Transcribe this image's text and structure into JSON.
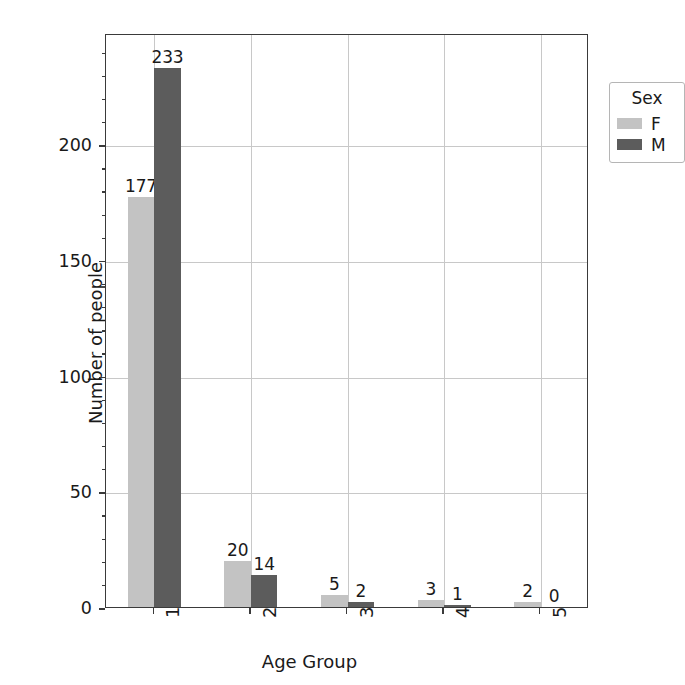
{
  "chart_data": {
    "type": "bar",
    "title": "",
    "xlabel": "Age Group",
    "ylabel": "Number of people",
    "categories": [
      "1",
      "2",
      "3",
      "4",
      "5"
    ],
    "series": [
      {
        "name": "F",
        "color": "#c3c3c3",
        "values": [
          177,
          20,
          5,
          3,
          2
        ]
      },
      {
        "name": "M",
        "color": "#5c5c5c",
        "values": [
          233,
          14,
          2,
          1,
          0
        ]
      }
    ],
    "legend": {
      "title": "Sex",
      "position": "upper right",
      "entries": [
        "F",
        "M"
      ]
    },
    "yticks": [
      0,
      50,
      100,
      150,
      200
    ],
    "ytick_labels": [
      "0",
      "50",
      "100",
      "150",
      "200"
    ],
    "ylim": [
      0,
      248
    ],
    "xtick_labels": [
      "1",
      "2",
      "3",
      "4",
      "5"
    ],
    "xtick_rotation": 90,
    "grid": true,
    "bar_labels": [
      [
        "177",
        "233"
      ],
      [
        "20",
        "14"
      ],
      [
        "5",
        "2"
      ],
      [
        "3",
        "1"
      ],
      [
        "2",
        "0"
      ]
    ]
  }
}
